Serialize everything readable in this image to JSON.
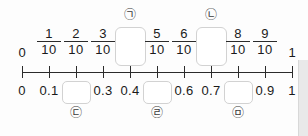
{
  "figure": {
    "type": "number-line",
    "title": "",
    "range": {
      "start": "0",
      "end": "1"
    },
    "divisions": 10,
    "axis": {
      "left_px": 22,
      "right_px": 292,
      "y_px": 72
    }
  },
  "top_row": {
    "description": "fractions in tenths above the number line",
    "items": [
      {
        "index": 0,
        "kind": "whole",
        "text": "0",
        "x": 22
      },
      {
        "index": 1,
        "kind": "fraction",
        "numerator": "1",
        "denominator": "10",
        "x": 49
      },
      {
        "index": 2,
        "kind": "fraction",
        "numerator": "2",
        "denominator": "10",
        "x": 76
      },
      {
        "index": 3,
        "kind": "fraction",
        "numerator": "3",
        "denominator": "10",
        "x": 103
      },
      {
        "index": 4,
        "kind": "blank-box",
        "marker": "㉠",
        "x": 130
      },
      {
        "index": 5,
        "kind": "fraction",
        "numerator": "5",
        "denominator": "10",
        "x": 157
      },
      {
        "index": 6,
        "kind": "fraction",
        "numerator": "6",
        "denominator": "10",
        "x": 184
      },
      {
        "index": 7,
        "kind": "blank-box",
        "marker": "㉡",
        "x": 211
      },
      {
        "index": 8,
        "kind": "fraction",
        "numerator": "8",
        "denominator": "10",
        "x": 238
      },
      {
        "index": 9,
        "kind": "fraction",
        "numerator": "9",
        "denominator": "10",
        "x": 265
      },
      {
        "index": 10,
        "kind": "whole",
        "text": "1",
        "x": 292
      }
    ]
  },
  "bottom_row": {
    "description": "decimals below the number line",
    "items": [
      {
        "index": 0,
        "kind": "decimal",
        "text": "0",
        "x": 22
      },
      {
        "index": 1,
        "kind": "decimal",
        "text": "0.1",
        "x": 49
      },
      {
        "index": 2,
        "kind": "blank-box",
        "marker": "㉢",
        "x": 76
      },
      {
        "index": 3,
        "kind": "decimal",
        "text": "0.3",
        "x": 103
      },
      {
        "index": 4,
        "kind": "decimal",
        "text": "0.4",
        "x": 130
      },
      {
        "index": 5,
        "kind": "blank-box",
        "marker": "㉣",
        "x": 157
      },
      {
        "index": 6,
        "kind": "decimal",
        "text": "0.6",
        "x": 184
      },
      {
        "index": 7,
        "kind": "decimal",
        "text": "0.7",
        "x": 211
      },
      {
        "index": 8,
        "kind": "blank-box",
        "marker": "㉤",
        "x": 238
      },
      {
        "index": 9,
        "kind": "decimal",
        "text": "0.9",
        "x": 265
      },
      {
        "index": 10,
        "kind": "decimal",
        "text": "1",
        "x": 292
      }
    ]
  },
  "markers": {
    "a": "㉠",
    "b": "㉡",
    "c": "㉢",
    "d": "㉣",
    "e": "㉤"
  },
  "colors": {
    "ink": "#2b2b2b",
    "box_border": "#d2d2d2",
    "background": "#fdfdfd"
  }
}
